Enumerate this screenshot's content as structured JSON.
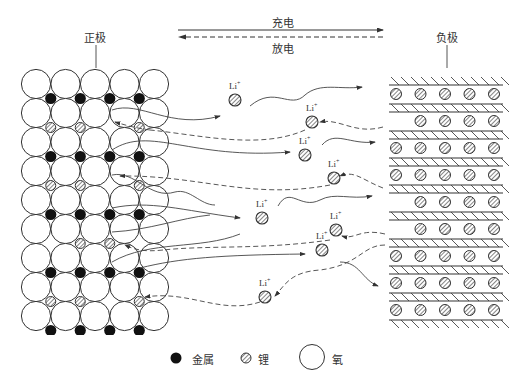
{
  "labels": {
    "cathode": "正极",
    "anode": "负极",
    "charge": "充电",
    "discharge": "放电"
  },
  "ion_label": "Li",
  "ion_charge": "+",
  "legend": [
    {
      "symbol": "metal",
      "label": "金属"
    },
    {
      "symbol": "lithium",
      "label": "锂"
    },
    {
      "symbol": "oxygen",
      "label": "氧"
    }
  ],
  "ions": [
    {
      "x": 235,
      "y": 100
    },
    {
      "x": 312,
      "y": 122
    },
    {
      "x": 305,
      "y": 155
    },
    {
      "x": 334,
      "y": 178
    },
    {
      "x": 262,
      "y": 218
    },
    {
      "x": 336,
      "y": 230
    },
    {
      "x": 322,
      "y": 250
    },
    {
      "x": 265,
      "y": 297
    }
  ]
}
